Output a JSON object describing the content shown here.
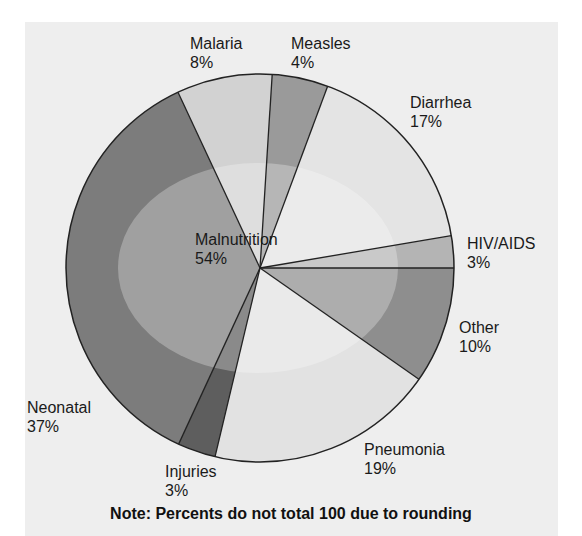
{
  "chart_data": {
    "type": "pie",
    "title": "",
    "note": "Note: Percents do not total 100 due to rounding",
    "start_angle_deg": 3.6,
    "center": [
      260,
      268
    ],
    "radius": 194,
    "slices": [
      {
        "label": "Measles",
        "value": 4,
        "color": "#9a9a9a",
        "start": 3.6,
        "end": 20.4
      },
      {
        "label": "Diarrhea",
        "value": 17,
        "color": "#e4e4e4",
        "start": 20.4,
        "end": 80.4
      },
      {
        "label": "HIV/AIDS",
        "value": 3,
        "color": "#b4b4b4",
        "start": 80.4,
        "end": 90
      },
      {
        "label": "Other",
        "value": 10,
        "color": "#8e8e8e",
        "start": 90,
        "end": 125
      },
      {
        "label": "Pneumonia",
        "value": 19,
        "color": "#e2e2e2",
        "start": 125,
        "end": 193.4
      },
      {
        "label": "Injuries",
        "value": 3,
        "color": "#5e5e5e",
        "start": 193.4,
        "end": 204.8
      },
      {
        "label": "Neonatal",
        "value": 37,
        "color": "#7c7c7c",
        "start": 204.8,
        "end": 335
      },
      {
        "label": "Malaria",
        "value": 8,
        "color": "#d2d2d2",
        "start": 335,
        "end": 363.6
      }
    ],
    "overlay": {
      "label": "Malnutrition",
      "value": 54,
      "shape": "ellipse",
      "cx": 258,
      "cy": 268,
      "rx": 140,
      "ry": 105,
      "color": "#ffffff",
      "opacity": 0.28
    }
  },
  "labels": {
    "malaria": {
      "name": "Malaria",
      "pct": "8%"
    },
    "measles": {
      "name": "Measles",
      "pct": "4%"
    },
    "diarrhea": {
      "name": "Diarrhea",
      "pct": "17%"
    },
    "hiv": {
      "name": "HIV/AIDS",
      "pct": "3%"
    },
    "other": {
      "name": "Other",
      "pct": "10%"
    },
    "pneumonia": {
      "name": "Pneumonia",
      "pct": "19%"
    },
    "injuries": {
      "name": "Injuries",
      "pct": "3%"
    },
    "neonatal": {
      "name": "Neonatal",
      "pct": "37%"
    },
    "malnutrition": {
      "name": "Malnutrition",
      "pct": "54%"
    }
  },
  "colors": {
    "panel_bg": "#eeeeee",
    "outline": "#222222"
  }
}
